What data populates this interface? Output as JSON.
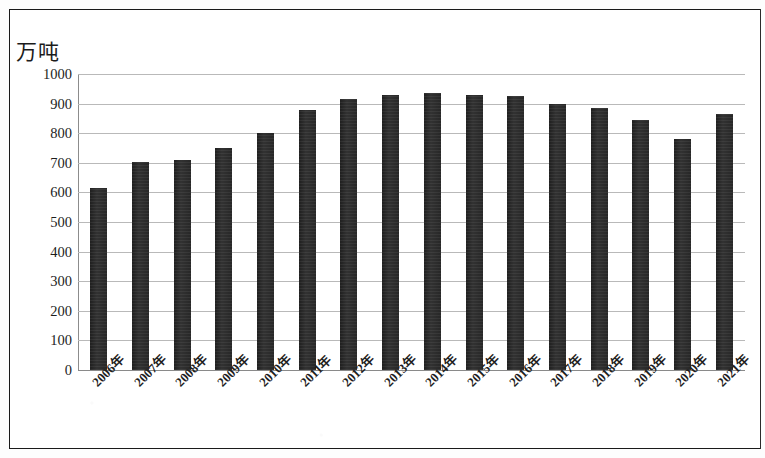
{
  "chart_data": {
    "type": "bar",
    "title": "",
    "subtitle": "",
    "xlabel": "",
    "ylabel": "万吨",
    "unit_label": "万吨",
    "categories": [
      "2006年",
      "2007年",
      "2008年",
      "2009年",
      "2010年",
      "2011年",
      "2012年",
      "2013年",
      "2014年",
      "2015年",
      "2016年",
      "2017年",
      "2018年",
      "2019年",
      "2020年",
      "2021年"
    ],
    "values": [
      615,
      703,
      710,
      750,
      800,
      880,
      915,
      928,
      935,
      930,
      925,
      900,
      885,
      845,
      780,
      865
    ],
    "series": [
      {
        "name": "产量",
        "values": [
          615,
          703,
          710,
          750,
          800,
          880,
          915,
          928,
          935,
          930,
          925,
          900,
          885,
          845,
          780,
          865
        ]
      }
    ],
    "ylim": [
      0,
      1000
    ],
    "ytick_labels": [
      "1000",
      "900",
      "800",
      "700",
      "600",
      "500",
      "400",
      "300",
      "200",
      "100",
      "0"
    ],
    "ytick_values": [
      1000,
      900,
      800,
      700,
      600,
      500,
      400,
      300,
      200,
      100,
      0
    ],
    "ytick_step": 100,
    "grid": true,
    "grid_axis": "y",
    "legend": false,
    "legend_position": "none",
    "bar_color": "#262626",
    "gridline_color": "#b9b9b9",
    "axis_color": "#8a8a8a",
    "background_color": "#ffffff",
    "xtick_rotation": -45
  }
}
